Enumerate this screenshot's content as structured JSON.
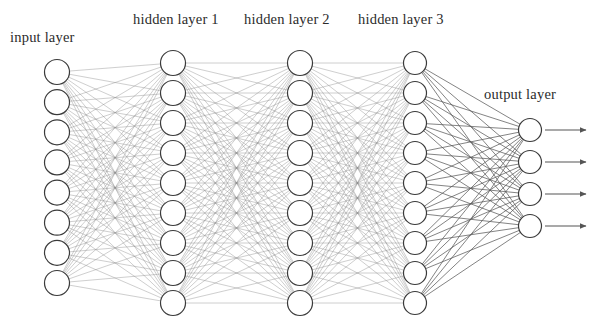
{
  "diagram": {
    "background_color": "#ffffff",
    "node_fill_color": "#ffffff",
    "node_stroke_color": "#3a3a3a",
    "edge_color": "#8a8a8a",
    "output_edge_color": "#555555",
    "arrow_color": "#555555",
    "text_color": "#2b2b2b"
  },
  "labels": {
    "input": "input layer",
    "hidden_1": "hidden layer 1",
    "hidden_2": "hidden layer 2",
    "hidden_3": "hidden layer 3",
    "output": "output layer"
  },
  "chart_data": {
    "type": "diagram",
    "layers": [
      {
        "id": "input",
        "label": "input layer",
        "node_count": 8,
        "cx": 57,
        "node_radius": 12.5,
        "y_top": 72,
        "y_bottom": 283
      },
      {
        "id": "hidden_1",
        "label": "hidden layer 1",
        "node_count": 9,
        "cx": 173,
        "node_radius": 12.5,
        "y_top": 63,
        "y_bottom": 303
      },
      {
        "id": "hidden_2",
        "label": "hidden layer 2",
        "node_count": 9,
        "cx": 300,
        "node_radius": 12.5,
        "y_top": 63,
        "y_bottom": 303
      },
      {
        "id": "hidden_3",
        "label": "hidden layer 3",
        "node_count": 9,
        "cx": 415,
        "node_radius": 11.5,
        "y_top": 63,
        "y_bottom": 303
      },
      {
        "id": "output",
        "label": "output layer",
        "node_count": 4,
        "cx": 530,
        "node_radius": 11.5,
        "y_top": 130,
        "y_bottom": 226
      }
    ],
    "connections": [
      {
        "from": "input",
        "to": "hidden_1",
        "fully_connected": true,
        "edge_count": 72
      },
      {
        "from": "hidden_1",
        "to": "hidden_2",
        "fully_connected": true,
        "edge_count": 81
      },
      {
        "from": "hidden_2",
        "to": "hidden_3",
        "fully_connected": true,
        "edge_count": 81
      },
      {
        "from": "hidden_3",
        "to": "output",
        "fully_connected": true,
        "edge_count": 36
      }
    ],
    "output_arrows": {
      "count": 4,
      "x_start": 545,
      "x_end": 586
    },
    "total_nodes": 39,
    "total_edges": 270
  }
}
